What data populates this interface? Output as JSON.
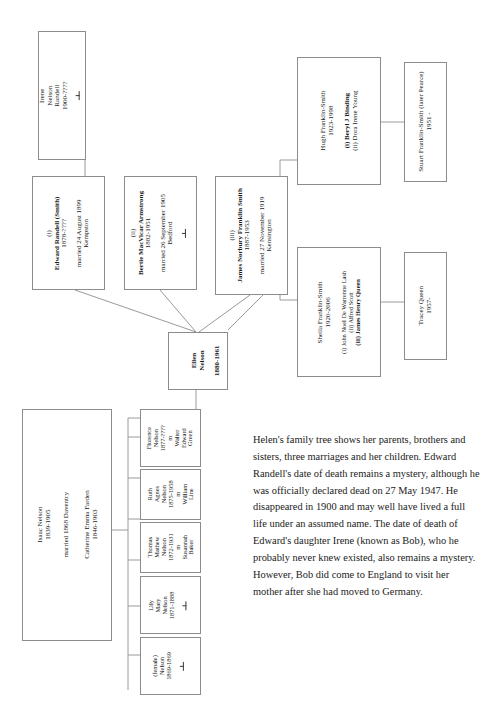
{
  "document": {
    "type": "family-tree-chart",
    "subject": "Ellen Nelson family tree"
  },
  "boxes": {
    "irene": {
      "name": "Irene",
      "line2": "Nelson",
      "line3": "Randell",
      "dates": "1900-????",
      "symbol": "deceased-tee"
    },
    "edward": {
      "ordinal": "(i)",
      "name": "Edward Randell (Smith)",
      "dates": "1878-????",
      "marriage": "married  24 August 1899",
      "place": "Kempston"
    },
    "bertie": {
      "ordinal": "(ii)",
      "name": "Bertie MacVicar Armstrong",
      "dates": "1882-1951",
      "marriage": "married 26 September 1905",
      "place": "Bedford",
      "symbol": "deceased-tee"
    },
    "james": {
      "ordinal": "(iii)",
      "name": "James Norbury Franklin Smith",
      "dates": "1887-1953",
      "marriage": "married 27 November 1919",
      "place": "Kensington"
    },
    "ellen": {
      "name": "Ellen",
      "surname": "Nelson",
      "dates": "1880-1961"
    },
    "hugh": {
      "name": "Hugh Franklin-Smith",
      "dates": "1923-1998",
      "spouse1": "(i) Beryl J Binding",
      "spouse2": "(ii) Dora Irene Young"
    },
    "stuart": {
      "name": "Stuart Franklin-Smith (later Pearce)",
      "dates": "1951 -"
    },
    "sheila": {
      "name": "Sheila Franklin-Smith",
      "dates": "1920-2006",
      "spouse1": "(i) John Noel De Warrenne Lash",
      "spouse2": "(ii) Alfred Scott",
      "spouse3": "(iii) James Henry Queen"
    },
    "tracey": {
      "name": "Tracey Queen",
      "dates": "1957-"
    },
    "parents": {
      "father_name": "Isaac Nelson",
      "father_dates": "1839-1905",
      "mother_name": "Catherine Emma Farden",
      "mother_dates": "1846-1903",
      "marriage": "married 1868 Daventry"
    },
    "florence": {
      "name1": "Florence",
      "name2": "Nelson",
      "dates": "1877-????",
      "m": "m",
      "spouse1": "Walter",
      "spouse2": "Edward",
      "spouse3": "Green"
    },
    "ruth": {
      "name1": "Ruth",
      "name2": "Agnes",
      "name3": "Nelson",
      "dates": "1875-1958",
      "m": "m",
      "spouse1": "William",
      "spouse2": "Line"
    },
    "thomas": {
      "name1": "Thomas",
      "name2": "Mathew",
      "name3": "Nelson",
      "dates": "1872-1931",
      "m": "m",
      "spouse1": "Susannah",
      "spouse2": "Baker"
    },
    "lily": {
      "name1": "Lily",
      "name2": "Mary",
      "name3": "Nelson",
      "dates": "1871-1888",
      "symbol": "deceased-tee"
    },
    "female": {
      "name1": "(female)",
      "name2": "Nelson",
      "dates": "1869-1869",
      "symbol": "deceased-tee"
    }
  },
  "note": {
    "text": "Helen's family tree shows her parents, brothers and sisters, three marriages and her children. Edward Randell's date of death remains a mystery, although he was officially declared dead on 27 May 1947. He disappeared in 1900 and may well have lived a full life under an assumed name. The date of death of Edward's daughter Irene (known as Bob), who he probably never knew existed, also remains a mystery. However, Bob did come to England to visit her mother after she had moved to Germany."
  }
}
